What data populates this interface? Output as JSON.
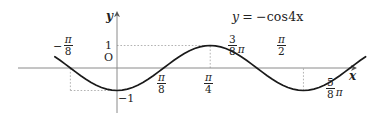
{
  "figure": {
    "background_color": "#ffffff",
    "curve_color": "#1a1a1a",
    "axis_color": "#808080",
    "guide_color": "#9a9a9a"
  },
  "equation": {
    "text": "y = −cos4x",
    "lhs": "y",
    "relation": "=",
    "rhs": "−cos4x"
  },
  "axes": {
    "x_axis_label": "x",
    "y_axis_label": "y",
    "origin_label": "O"
  },
  "y_ticks": [
    {
      "label": "1",
      "value": 1
    },
    {
      "label": "−1",
      "value": -1
    }
  ],
  "x_ticks": [
    {
      "id": "neg-pi-over-8",
      "sign": "−",
      "numer": "π",
      "denom": "8",
      "pi_suffix": "",
      "value": -0.3927,
      "position": "above"
    },
    {
      "id": "pi-over-8",
      "sign": "",
      "numer": "π",
      "denom": "8",
      "pi_suffix": "",
      "value": 0.3927,
      "position": "below"
    },
    {
      "id": "pi-over-4",
      "sign": "",
      "numer": "π",
      "denom": "4",
      "pi_suffix": "",
      "value": 0.7854,
      "position": "below"
    },
    {
      "id": "three-eighths-pi",
      "sign": "",
      "numer": "3",
      "denom": "8",
      "pi_suffix": "π",
      "value": 1.1781,
      "position": "above"
    },
    {
      "id": "pi-over-2",
      "sign": "",
      "numer": "π",
      "denom": "2",
      "pi_suffix": "",
      "value": 1.5708,
      "position": "above"
    },
    {
      "id": "five-eighths-pi",
      "sign": "",
      "numer": "5",
      "denom": "8",
      "pi_suffix": "π",
      "value": 1.9635,
      "position": "below"
    }
  ],
  "chart_data": {
    "type": "line",
    "title": "",
    "subtitle": "",
    "xlabel": "x",
    "ylabel": "y",
    "function": "y = -cos(4x)",
    "xlim": [
      -0.5236,
      2.0944
    ],
    "ylim": [
      -1.35,
      1.35
    ],
    "grid": false,
    "legend": null,
    "annotations": [
      {
        "text": "y = −cos4x",
        "x": 1.55,
        "y": 1.3
      },
      {
        "text": "O",
        "x": -0.05,
        "y": 0.18
      }
    ],
    "guides": [
      {
        "type": "horizontal-dotted",
        "y": 1,
        "from_x": 0,
        "to_x": 0.7854
      },
      {
        "type": "vertical-dotted",
        "x": 0.7854,
        "from_y": 0,
        "to_y": 1
      },
      {
        "type": "horizontal-dotted",
        "y": -1,
        "from_x": -0.3927,
        "to_x": 0
      },
      {
        "type": "vertical-dotted",
        "x": -0.3927,
        "from_y": -1,
        "to_y": 0
      },
      {
        "type": "vertical-dotted",
        "x": 1.5708,
        "from_y": -1,
        "to_y": 0
      }
    ],
    "key_points": [
      {
        "label": "zero",
        "x": -0.3927,
        "y": 0
      },
      {
        "label": "minimum",
        "x": 0,
        "y": -1
      },
      {
        "label": "zero",
        "x": 0.3927,
        "y": 0
      },
      {
        "label": "maximum",
        "x": 0.7854,
        "y": 1
      },
      {
        "label": "zero",
        "x": 1.1781,
        "y": 0
      },
      {
        "label": "minimum",
        "x": 1.5708,
        "y": -1
      },
      {
        "label": "zero",
        "x": 1.9635,
        "y": 0
      }
    ],
    "x": [
      -0.5236,
      -0.4799,
      -0.4363,
      -0.3927,
      -0.3491,
      -0.3054,
      -0.2618,
      -0.2182,
      -0.1745,
      -0.1309,
      -0.0873,
      -0.0436,
      0.0,
      0.0436,
      0.0873,
      0.1309,
      0.1745,
      0.2182,
      0.2618,
      0.3054,
      0.3491,
      0.3927,
      0.4363,
      0.4799,
      0.5236,
      0.5672,
      0.6109,
      0.6545,
      0.6981,
      0.7418,
      0.7854,
      0.829,
      0.8727,
      0.9163,
      0.9599,
      1.0036,
      1.0472,
      1.0908,
      1.1345,
      1.1781,
      1.2217,
      1.2654,
      1.309,
      1.3526,
      1.3963,
      1.4399,
      1.4835,
      1.5272,
      1.5708,
      1.6144,
      1.6581,
      1.7017,
      1.7453,
      1.789,
      1.8326,
      1.8762,
      1.9199,
      1.9635,
      2.0071,
      2.0508,
      2.0944
    ],
    "y": [
      0.5,
      0.342,
      0.174,
      0.0,
      -0.174,
      -0.342,
      -0.5,
      -0.643,
      -0.766,
      -0.866,
      -0.94,
      -0.985,
      -1.0,
      -0.985,
      -0.94,
      -0.866,
      -0.766,
      -0.643,
      -0.5,
      -0.342,
      -0.174,
      0.0,
      0.174,
      0.342,
      0.5,
      0.643,
      0.766,
      0.866,
      0.94,
      0.985,
      1.0,
      0.985,
      0.94,
      0.866,
      0.766,
      0.643,
      0.5,
      0.342,
      0.174,
      0.0,
      -0.174,
      -0.342,
      -0.5,
      -0.643,
      -0.766,
      -0.866,
      -0.94,
      -0.985,
      -1.0,
      -0.985,
      -0.94,
      -0.866,
      -0.766,
      -0.643,
      -0.5,
      -0.342,
      -0.174,
      0.0,
      0.174,
      0.342,
      0.5
    ]
  }
}
